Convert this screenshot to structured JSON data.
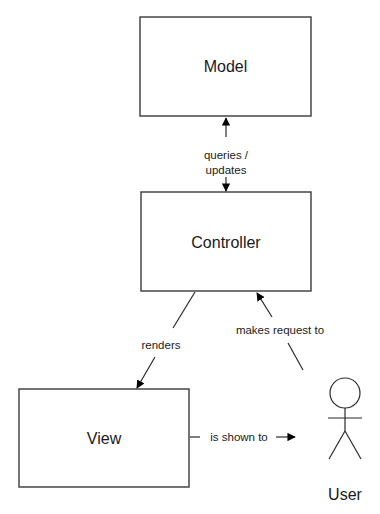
{
  "diagram": {
    "type": "MVC architecture",
    "nodes": {
      "model": {
        "label": "Model"
      },
      "controller": {
        "label": "Controller"
      },
      "view": {
        "label": "View"
      },
      "user": {
        "label": "User",
        "shape": "actor-stick-figure"
      }
    },
    "edges": {
      "model_controller": {
        "label_line1": "queries /",
        "label_line2": "updates",
        "from": "Controller",
        "to": "Model",
        "bidirectional": true
      },
      "controller_view": {
        "label": "renders",
        "from": "Controller",
        "to": "View"
      },
      "user_controller": {
        "label": "makes request to",
        "from": "User",
        "to": "Controller"
      },
      "view_user": {
        "label": "is shown to",
        "from": "View",
        "to": "User"
      }
    },
    "colors": {
      "stroke": "#2a2a2a",
      "text": "#1a1a1a",
      "background": "#ffffff"
    }
  }
}
